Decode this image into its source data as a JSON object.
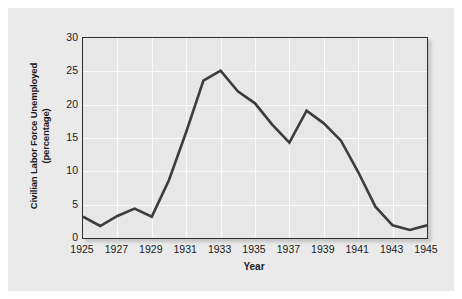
{
  "chart_data": {
    "type": "line",
    "title": "",
    "xlabel": "Year",
    "ylabel": "Civilian Labor Force Unemployed (percentage)",
    "ylabel_line1": "Civilian Labor Force Unemployed",
    "ylabel_line2": "(percentage)",
    "xlim": [
      1925,
      1945
    ],
    "ylim": [
      0,
      30
    ],
    "grid": true,
    "legend": "none",
    "line_color": "#3c3c3c",
    "plot_bg_color": "#e7e7e7",
    "panel_bg_color": "#eaeaea",
    "gridline_color": "#fafafa",
    "axis_color": "#2e2e2e",
    "xticks": [
      1925,
      1927,
      1929,
      1931,
      1933,
      1935,
      1937,
      1939,
      1941,
      1943,
      1945
    ],
    "xtick_labels": [
      "1925",
      "1927",
      "1929",
      "1931",
      "1933",
      "1935",
      "1937",
      "1939",
      "1941",
      "1943",
      "1945"
    ],
    "yticks": [
      0,
      5,
      10,
      15,
      20,
      25,
      30
    ],
    "ytick_labels": [
      "0",
      "5",
      "10",
      "15",
      "20",
      "25",
      "30"
    ],
    "x": [
      1925,
      1926,
      1927,
      1928,
      1929,
      1930,
      1931,
      1932,
      1933,
      1934,
      1935,
      1936,
      1937,
      1938,
      1939,
      1940,
      1941,
      1942,
      1943,
      1944,
      1945
    ],
    "values": [
      3.2,
      1.8,
      3.3,
      4.4,
      3.2,
      8.7,
      15.9,
      23.6,
      25.1,
      22.0,
      20.2,
      17.0,
      14.3,
      19.1,
      17.2,
      14.6,
      9.9,
      4.7,
      1.9,
      1.2,
      1.9
    ],
    "series": [
      {
        "name": "Civilian Labor Force Unemployed",
        "values": [
          3.2,
          1.8,
          3.3,
          4.4,
          3.2,
          8.7,
          15.9,
          23.6,
          25.1,
          22.0,
          20.2,
          17.0,
          14.3,
          19.1,
          17.2,
          14.6,
          9.9,
          4.7,
          1.9,
          1.2,
          1.9
        ]
      }
    ]
  }
}
